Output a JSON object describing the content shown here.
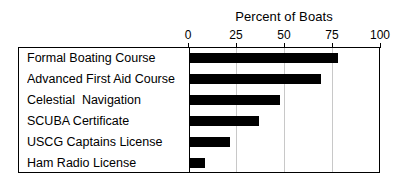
{
  "chart_data": {
    "type": "bar",
    "orientation": "horizontal",
    "title": "Percent of Boats",
    "xlabel": "",
    "ylabel": "",
    "xlim": [
      0,
      100
    ],
    "xticks": [
      0,
      25,
      50,
      75,
      100
    ],
    "xtick_labels": [
      "0",
      "25",
      "50",
      "75",
      "100"
    ],
    "grid": true,
    "legend": false,
    "bar_color": "#000000",
    "frame_color": "#000000",
    "gridline_color": "#c8c8c8",
    "categories": [
      "Formal Boating Course",
      "Advanced First Aid Course",
      "Celestial  Navigation",
      "SCUBA Certificate",
      "USCG Captains License",
      "Ham Radio License"
    ],
    "values": [
      77,
      68,
      47,
      36,
      21,
      8
    ]
  },
  "axis": {
    "ticks": [
      {
        "label": "0",
        "value": 0
      },
      {
        "label": "25",
        "value": 25
      },
      {
        "label": "50",
        "value": 50
      },
      {
        "label": "75",
        "value": 75
      },
      {
        "label": "100",
        "value": 100
      }
    ]
  }
}
